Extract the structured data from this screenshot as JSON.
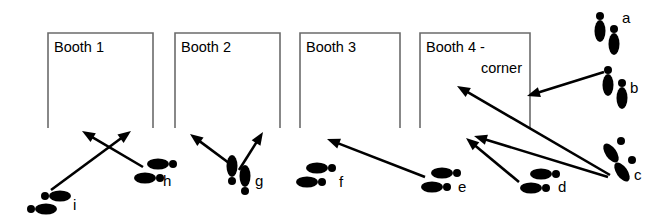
{
  "diagram": {
    "background_color": "#ffffff",
    "ink_color": "#000000",
    "wall_color": "#6b6b6b",
    "width": 665,
    "height": 219,
    "booths": [
      {
        "id": "booth-1",
        "lines": [
          "Booth 1"
        ],
        "x": 48,
        "y": 33,
        "w": 105,
        "h": 95,
        "label_align": "left"
      },
      {
        "id": "booth-2",
        "lines": [
          "Booth 2"
        ],
        "x": 175,
        "y": 33,
        "w": 105,
        "h": 95,
        "label_align": "left"
      },
      {
        "id": "booth-3",
        "lines": [
          "Booth 3"
        ],
        "x": 300,
        "y": 33,
        "w": 100,
        "h": 95,
        "label_align": "left"
      },
      {
        "id": "booth-4",
        "lines": [
          "Booth 4 -",
          "corner"
        ],
        "x": 420,
        "y": 33,
        "w": 110,
        "h": 95,
        "label_align": "left"
      }
    ],
    "footprints": [
      {
        "id": "a",
        "label": "a",
        "label_x": 622,
        "label_y": 23,
        "orientation": "vertical-down",
        "feet": [
          {
            "heel_cx": 600,
            "heel_cy": 31,
            "heel_rx": 5.5,
            "heel_ry": 11,
            "toe_cx": 600,
            "toe_cy": 16,
            "toe_r": 4,
            "rot": 0
          },
          {
            "heel_cx": 614,
            "heel_cy": 44,
            "heel_rx": 5.5,
            "heel_ry": 11,
            "toe_cx": 614,
            "toe_cy": 29,
            "toe_r": 4,
            "rot": 0
          }
        ]
      },
      {
        "id": "b",
        "label": "b",
        "label_x": 630,
        "label_y": 93,
        "orientation": "vertical-down",
        "feet": [
          {
            "heel_cx": 608,
            "heel_cy": 85,
            "heel_rx": 5.5,
            "heel_ry": 11,
            "toe_cx": 608,
            "toe_cy": 70,
            "toe_r": 4,
            "rot": 0
          },
          {
            "heel_cx": 622,
            "heel_cy": 98,
            "heel_rx": 5.5,
            "heel_ry": 11,
            "toe_cx": 622,
            "toe_cy": 83,
            "toe_r": 4,
            "rot": 0
          }
        ]
      },
      {
        "id": "c",
        "label": "c",
        "label_x": 634,
        "label_y": 180,
        "orientation": "tilted-down-left",
        "feet": [
          {
            "heel_cx": 611,
            "heel_cy": 153,
            "heel_rx": 5.5,
            "heel_ry": 11,
            "toe_cx": 621,
            "toe_cy": 141,
            "toe_r": 4,
            "rot": -35
          },
          {
            "heel_cx": 622,
            "heel_cy": 172,
            "heel_rx": 5.5,
            "heel_ry": 11,
            "toe_cx": 632,
            "toe_cy": 160,
            "toe_r": 4,
            "rot": -35
          }
        ]
      },
      {
        "id": "d",
        "label": "d",
        "label_x": 558,
        "label_y": 192,
        "orientation": "horizontal-left",
        "feet": [
          {
            "heel_cx": 541,
            "heel_cy": 174,
            "heel_rx": 11,
            "heel_ry": 5.5,
            "toe_cx": 556,
            "toe_cy": 174,
            "toe_r": 4,
            "rot": 0
          },
          {
            "heel_cx": 531,
            "heel_cy": 188,
            "heel_rx": 11,
            "heel_ry": 5.5,
            "toe_cx": 546,
            "toe_cy": 188,
            "toe_r": 4,
            "rot": 0
          }
        ]
      },
      {
        "id": "e",
        "label": "e",
        "label_x": 458,
        "label_y": 192,
        "orientation": "horizontal-left",
        "feet": [
          {
            "heel_cx": 442,
            "heel_cy": 173,
            "heel_rx": 11,
            "heel_ry": 5.5,
            "toe_cx": 457,
            "toe_cy": 173,
            "toe_r": 4,
            "rot": 0
          },
          {
            "heel_cx": 432,
            "heel_cy": 187,
            "heel_rx": 11,
            "heel_ry": 5.5,
            "toe_cx": 447,
            "toe_cy": 187,
            "toe_r": 4,
            "rot": 0
          }
        ]
      },
      {
        "id": "f",
        "label": "f",
        "label_x": 339,
        "label_y": 187,
        "orientation": "horizontal-left",
        "feet": [
          {
            "heel_cx": 317,
            "heel_cy": 168,
            "heel_rx": 11,
            "heel_ry": 5.5,
            "toe_cx": 332,
            "toe_cy": 168,
            "toe_r": 4,
            "rot": 0
          },
          {
            "heel_cx": 307,
            "heel_cy": 182,
            "heel_rx": 11,
            "heel_ry": 5.5,
            "toe_cx": 322,
            "toe_cy": 182,
            "toe_r": 4,
            "rot": 0
          }
        ]
      },
      {
        "id": "g",
        "label": "g",
        "label_x": 255,
        "label_y": 186,
        "orientation": "vertical-down",
        "feet": [
          {
            "heel_cx": 232,
            "heel_cy": 166,
            "heel_rx": 5.5,
            "heel_ry": 11,
            "toe_cx": 232,
            "toe_cy": 181,
            "toe_r": 4,
            "rot": 0
          },
          {
            "heel_cx": 245,
            "heel_cy": 176,
            "heel_rx": 5.5,
            "heel_ry": 11,
            "toe_cx": 245,
            "toe_cy": 191,
            "toe_r": 4,
            "rot": 0
          }
        ]
      },
      {
        "id": "h",
        "label": "h",
        "label_x": 163,
        "label_y": 186,
        "orientation": "horizontal-left",
        "feet": [
          {
            "heel_cx": 158,
            "heel_cy": 164,
            "heel_rx": 11,
            "heel_ry": 5.5,
            "toe_cx": 173,
            "toe_cy": 164,
            "toe_r": 4,
            "rot": 0
          },
          {
            "heel_cx": 145,
            "heel_cy": 178,
            "heel_rx": 11,
            "heel_ry": 5.5,
            "toe_cx": 160,
            "toe_cy": 178,
            "toe_r": 4,
            "rot": 0
          }
        ]
      },
      {
        "id": "i",
        "label": "i",
        "label_x": 73,
        "label_y": 210,
        "orientation": "horizontal-right",
        "feet": [
          {
            "heel_cx": 60,
            "heel_cy": 196,
            "heel_rx": 11,
            "heel_ry": 5.5,
            "toe_cx": 45,
            "toe_cy": 196,
            "toe_r": 4,
            "rot": 0
          },
          {
            "heel_cx": 46,
            "heel_cy": 209,
            "heel_rx": 11,
            "heel_ry": 5.5,
            "toe_cx": 31,
            "toe_cy": 209,
            "toe_r": 4,
            "rot": 0
          }
        ]
      }
    ],
    "arrows": [
      {
        "id": "arrow-i-to-booth2",
        "from": "i",
        "to": "booth-2-front",
        "x1": 51,
        "y1": 190,
        "x2": 131,
        "y2": 131
      },
      {
        "id": "arrow-h-to-booth1",
        "from": "h",
        "to": "booth-1-front",
        "x1": 143,
        "y1": 167,
        "x2": 82,
        "y2": 131
      },
      {
        "id": "arrow-g-to-booth2-left",
        "from": "g",
        "to": "booth-2-left",
        "x1": 233,
        "y1": 166,
        "x2": 190,
        "y2": 134
      },
      {
        "id": "arrow-g-to-booth2-right",
        "from": "g",
        "to": "booth-2-right",
        "x1": 239,
        "y1": 170,
        "x2": 263,
        "y2": 132
      },
      {
        "id": "arrow-e-to-booth3",
        "from": "e",
        "to": "booth-3-front",
        "x1": 425,
        "y1": 177,
        "x2": 327,
        "y2": 139
      },
      {
        "id": "arrow-d-to-booth4",
        "from": "d",
        "to": "booth-4-front",
        "x1": 519,
        "y1": 182,
        "x2": 466,
        "y2": 138
      },
      {
        "id": "arrow-c-to-booth4-low",
        "from": "c",
        "to": "booth-4-front",
        "x1": 608,
        "y1": 177,
        "x2": 474,
        "y2": 136
      },
      {
        "id": "arrow-c-to-booth4-high",
        "from": "c",
        "to": "booth-4-upper",
        "x1": 610,
        "y1": 175,
        "x2": 457,
        "y2": 86
      },
      {
        "id": "arrow-b-to-booth4-upper",
        "from": "b",
        "to": "booth-4-upper",
        "x1": 604,
        "y1": 72,
        "x2": 527,
        "y2": 96
      }
    ]
  }
}
